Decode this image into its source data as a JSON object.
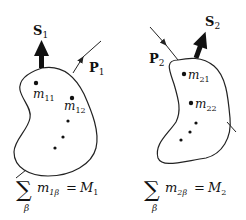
{
  "diagram": {
    "title": "",
    "colors": {
      "stroke": "#222222",
      "text": "#111111",
      "background": "#ffffff"
    },
    "bodies": [
      {
        "id": "body-1",
        "momentum_label": "P",
        "momentum_sub": "1",
        "spin_label": "S",
        "spin_sub": "1",
        "masses": [
          {
            "base": "m",
            "sub": "11"
          },
          {
            "base": "m",
            "sub": "12"
          }
        ],
        "extra_dots": 3,
        "sum_symbol": "∑",
        "sum_index": "β",
        "sum_term_base": "m",
        "sum_term_sub": "1β",
        "equals": "=",
        "total_base": "M",
        "total_sub": "1"
      },
      {
        "id": "body-2",
        "momentum_label": "P",
        "momentum_sub": "2",
        "spin_label": "S",
        "spin_sub": "2",
        "masses": [
          {
            "base": "m",
            "sub": "21"
          },
          {
            "base": "m",
            "sub": "22"
          }
        ],
        "extra_dots": 3,
        "sum_symbol": "∑",
        "sum_index": "β",
        "sum_term_base": "m",
        "sum_term_sub": "2β",
        "equals": "=",
        "total_base": "M",
        "total_sub": "2"
      }
    ]
  }
}
